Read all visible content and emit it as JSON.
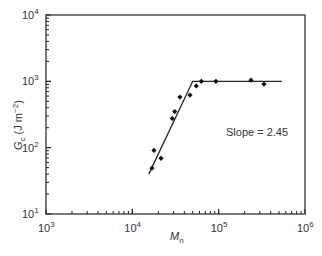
{
  "chart_data": {
    "type": "scatter",
    "title": "",
    "xlabel": "M_n",
    "ylabel": "G_c (J m^-2)",
    "xscale": "log",
    "yscale": "log",
    "xlim": [
      1000,
      1000000
    ],
    "ylim": [
      10,
      10000
    ],
    "x_ticks": [
      "10^3",
      "10^4",
      "10^5",
      "10^6"
    ],
    "y_ticks": [
      "10^1",
      "10^2",
      "10^3",
      "10^4"
    ],
    "grid": false,
    "legend": null,
    "series": [
      {
        "name": "data",
        "marker": "diamond",
        "points": [
          {
            "x": 16900,
            "y": 49
          },
          {
            "x": 17800,
            "y": 91
          },
          {
            "x": 21500,
            "y": 69
          },
          {
            "x": 29000,
            "y": 275
          },
          {
            "x": 31000,
            "y": 350
          },
          {
            "x": 35600,
            "y": 580
          },
          {
            "x": 46500,
            "y": 620
          },
          {
            "x": 55000,
            "y": 850
          },
          {
            "x": 63000,
            "y": 1000
          },
          {
            "x": 93000,
            "y": 1000
          },
          {
            "x": 237000,
            "y": 1040
          },
          {
            "x": 335000,
            "y": 910
          }
        ]
      },
      {
        "name": "fit",
        "type": "line",
        "points": [
          {
            "x": 15500,
            "y": 40
          },
          {
            "x": 50000,
            "y": 1000
          },
          {
            "x": 540000,
            "y": 1000
          }
        ]
      }
    ],
    "annotations": [
      {
        "text": "Slope = 2.45",
        "x": 130000,
        "y": 230
      }
    ]
  },
  "labels": {
    "xlabel_main": "M",
    "xlabel_sub": "n",
    "ylabel_main": "G",
    "ylabel_sub": "c",
    "ylabel_rest": " (J m",
    "ylabel_sup": "−2",
    "ylabel_close": ")",
    "slope_text": "Slope = 2.45",
    "x_tick_base": "10",
    "x_tick_exps": [
      "3",
      "4",
      "5",
      "6"
    ],
    "y_tick_base": "10",
    "y_tick_exps": [
      "1",
      "2",
      "3",
      "4"
    ]
  }
}
